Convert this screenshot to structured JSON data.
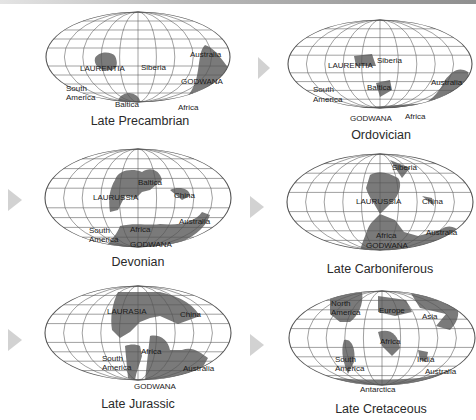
{
  "figure": {
    "arrow_color": "#d2d2d2",
    "land_color": "#7a7a7a",
    "panels": [
      {
        "period": "Late Precambrian",
        "labels": [
          "LAURENTIA",
          "Siberia",
          "Australia",
          "GODWANA",
          "South America",
          "Baltica",
          "Africa"
        ]
      },
      {
        "period": "Ordovician",
        "labels": [
          "LAURENTIA",
          "Siberia",
          "Baltica",
          "South America",
          "Australia",
          "GODWANA",
          "Africa"
        ]
      },
      {
        "period": "Devonian",
        "labels": [
          "Baltica",
          "LAURUSSIA",
          "China",
          "Australia",
          "South America",
          "Africa",
          "GODWANA"
        ]
      },
      {
        "period": "Late Carboniferous",
        "labels": [
          "Siberia",
          "LAURUSSIA",
          "China",
          "Africa",
          "Australia",
          "GODWANA"
        ]
      },
      {
        "period": "Late Jurassic",
        "labels": [
          "LAURASIA",
          "China",
          "Africa",
          "South America",
          "Australia",
          "GODWANA"
        ]
      },
      {
        "period": "Late Cretaceous",
        "labels": [
          "North America",
          "Europe",
          "Asia",
          "Africa",
          "South America",
          "India",
          "Australia",
          "Antarctica"
        ]
      }
    ]
  },
  "t": {
    "p1": {
      "laurentia": "LAURENTIA",
      "siberia": "Siberia",
      "australia": "Australia",
      "godwana": "GODWANA",
      "south": "South",
      "america": "America",
      "baltica": "Baltica",
      "africa": "Africa"
    },
    "p2": {
      "laurentia": "LAURENTIA",
      "siberia": "Siberia",
      "baltica": "Baltica",
      "south": "South",
      "america": "America",
      "australia": "Australia",
      "godwana": "GODWANA",
      "africa": "Africa"
    },
    "p3": {
      "baltica": "Baltica",
      "laurussia": "LAURUSSIA",
      "china": "China",
      "australia": "Australia",
      "south": "South",
      "america": "America",
      "africa": "Africa",
      "godwana": "GODWANA"
    },
    "p4": {
      "siberia": "Siberia",
      "laurussia": "LAURUSSIA",
      "china": "China",
      "africa": "Africa",
      "australia": "Australia",
      "godwana": "GODWANA"
    },
    "p5": {
      "laurasia": "LAURASIA",
      "china": "China",
      "africa": "Africa",
      "south": "South",
      "america": "America",
      "australia": "Australia",
      "godwana": "GODWANA"
    },
    "p6": {
      "north": "North",
      "america1": "America",
      "europe": "Europe",
      "asia": "Asia",
      "africa": "Africa",
      "south": "South",
      "america2": "America",
      "india": "India",
      "australia": "Australia",
      "antarctica": "Antarctica"
    }
  }
}
